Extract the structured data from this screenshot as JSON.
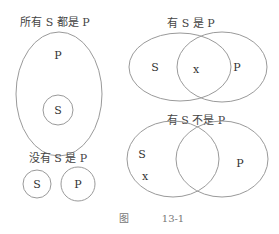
{
  "figure": {
    "caption_prefix": "图",
    "caption_number": "13-1"
  },
  "diagrams": {
    "all_s_are_p": {
      "title": "所有 S 都是 P",
      "outer_label": "P",
      "inner_label": "S"
    },
    "some_s_are_p": {
      "title": "有 S 是 P",
      "left_label": "S",
      "overlap_label": "x",
      "right_label": "P"
    },
    "no_s_is_p": {
      "title": "没有 S 是 P",
      "left_label": "S",
      "right_label": "P"
    },
    "some_s_not_p": {
      "title": "有 S 不是 P",
      "left_label": "S",
      "left_mark": "x",
      "right_label": "P"
    }
  },
  "colors": {
    "stroke": "#9a9a9a",
    "text": "#333333"
  }
}
